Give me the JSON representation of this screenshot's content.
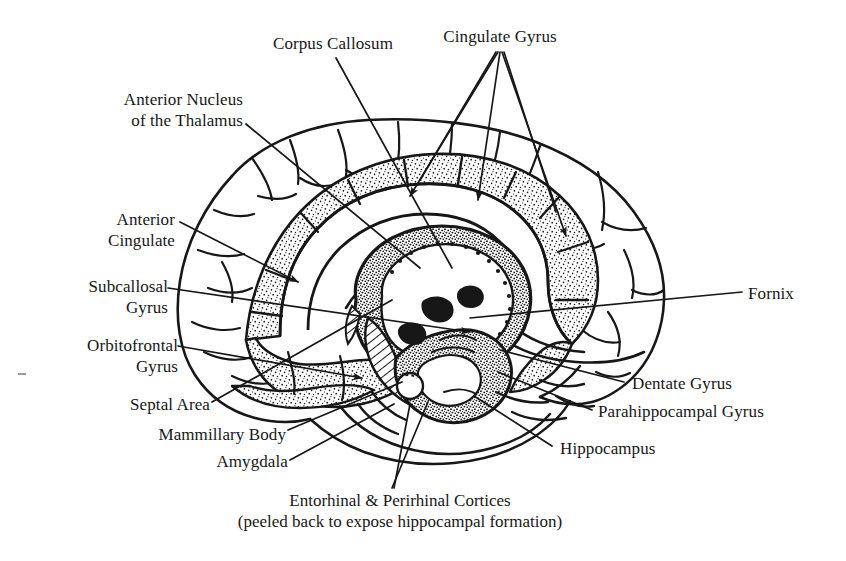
{
  "figure": {
    "style": "black-and-white pen-and-ink anatomical line drawing with stippled shading",
    "background_color": "#ffffff",
    "ink_color": "#171717"
  },
  "labels": {
    "corpus_callosum": "Corpus Callosum",
    "cingulate_gyrus": "Cingulate Gyrus",
    "anterior_nucleus_line1": "Anterior Nucleus",
    "anterior_nucleus_line2": "of the Thalamus",
    "anterior_cingulate_line1": "Anterior",
    "anterior_cingulate_line2": "Cingulate",
    "subcallosal_line1": "Subcallosal",
    "subcallosal_line2": "Gyrus",
    "orbitofrontal_line1": "Orbitofrontal",
    "orbitofrontal_line2": "Gyrus",
    "septal_area": "Septal Area",
    "mammillary_body": "Mammillary Body",
    "amygdala": "Amygdala",
    "fornix": "Fornix",
    "dentate_gyrus": "Dentate Gyrus",
    "parahippocampal_gyrus": "Parahippocampal Gyrus",
    "hippocampus": "Hippocampus"
  },
  "caption": {
    "line1": "Entorhinal & Perirhinal Cortices",
    "line2": "(peeled back to expose hippocampal formation)"
  },
  "structures": [
    {
      "name": "cerebral-cortex-outline",
      "shading": "outline only"
    },
    {
      "name": "cingulate-gyrus-band",
      "shading": "stippled"
    },
    {
      "name": "parahippocampal-band",
      "shading": "stippled"
    },
    {
      "name": "hippocampal-formation",
      "shading": "dense stipple and hatching"
    },
    {
      "name": "corpus-callosum-body",
      "shading": "outline only"
    },
    {
      "name": "fornix-arch",
      "shading": "outline only"
    },
    {
      "name": "brainstem-cerebellum",
      "shading": "outline only"
    }
  ]
}
